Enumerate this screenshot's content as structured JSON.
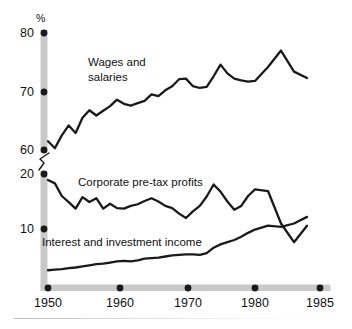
{
  "chart_data": {
    "type": "line",
    "title": "",
    "xlabel": "",
    "ylabel": "%",
    "axis_break": true,
    "grid": false,
    "legend_position": "inline-annotations",
    "x_ticks": [
      1950,
      1960,
      1970,
      1980,
      1985
    ],
    "x_tick_labels": [
      "1950",
      "1960",
      "1970",
      "1980",
      "1985"
    ],
    "y_ticks_upper": [
      60,
      70,
      80
    ],
    "y_tick_labels_upper": [
      "60",
      "70",
      "80"
    ],
    "y_ticks_lower": [
      10,
      20
    ],
    "y_tick_labels_lower": [
      "10",
      "20"
    ],
    "ylim_upper": [
      60,
      80
    ],
    "ylim_lower": [
      0,
      20
    ],
    "xlim": [
      1950,
      1985
    ],
    "units": "%",
    "series": [
      {
        "name": "Wages and salaries",
        "label_line1": "Wages and",
        "label_line2": "salaries",
        "color": "#1a1a1a",
        "x": [
          1950,
          1951,
          1952,
          1953,
          1954,
          1955,
          1956,
          1957,
          1958,
          1959,
          1960,
          1961,
          1962,
          1963,
          1964,
          1965,
          1966,
          1967,
          1968,
          1969,
          1970,
          1971,
          1972,
          1973,
          1974,
          1975,
          1976,
          1977,
          1978,
          1979,
          1980,
          1981,
          1982,
          1983,
          1984
        ],
        "values": [
          61.5,
          60.3,
          62.5,
          64.2,
          62.9,
          65.5,
          66.8,
          65.9,
          66.7,
          67.5,
          68.6,
          67.9,
          67.6,
          68.0,
          68.4,
          69.5,
          69.2,
          70.2,
          70.9,
          72.1,
          72.2,
          70.9,
          70.6,
          70.8,
          72.6,
          74.6,
          73.1,
          72.2,
          71.9,
          71.7,
          71.8,
          74.2,
          77.0,
          73.4,
          72.3
        ]
      },
      {
        "name": "Corporate pre-tax profits",
        "label_line1": "Corporate pre-tax profits",
        "color": "#1a1a1a",
        "x": [
          1950,
          1951,
          1952,
          1953,
          1954,
          1955,
          1956,
          1957,
          1958,
          1959,
          1960,
          1961,
          1962,
          1963,
          1964,
          1965,
          1966,
          1967,
          1968,
          1969,
          1970,
          1971,
          1972,
          1973,
          1974,
          1975,
          1976,
          1977,
          1978,
          1979,
          1980,
          1981,
          1982,
          1983,
          1984
        ],
        "values": [
          18.9,
          18.3,
          16.0,
          14.9,
          13.7,
          15.8,
          14.9,
          15.6,
          13.7,
          14.6,
          13.8,
          13.7,
          14.2,
          14.5,
          15.1,
          15.6,
          15.0,
          14.2,
          13.8,
          12.8,
          12.0,
          13.2,
          14.2,
          15.9,
          18.1,
          16.8,
          15.0,
          13.5,
          14.2,
          16.0,
          17.2,
          16.9,
          11.0,
          7.6,
          10.6
        ]
      },
      {
        "name": "Interest and investment income",
        "label_line1": "Interest and investment income",
        "color": "#1a1a1a",
        "x": [
          1950,
          1951,
          1952,
          1953,
          1954,
          1955,
          1956,
          1957,
          1958,
          1959,
          1960,
          1961,
          1962,
          1963,
          1964,
          1965,
          1966,
          1967,
          1968,
          1969,
          1970,
          1971,
          1972,
          1973,
          1974,
          1975,
          1976,
          1977,
          1978,
          1979,
          1980,
          1981,
          1982,
          1983,
          1984
        ],
        "values": [
          2.5,
          2.6,
          2.7,
          2.9,
          3.0,
          3.2,
          3.4,
          3.6,
          3.7,
          3.9,
          4.1,
          4.2,
          4.1,
          4.3,
          4.6,
          4.7,
          4.8,
          5.0,
          5.2,
          5.3,
          5.4,
          5.4,
          5.3,
          5.6,
          6.6,
          7.2,
          7.6,
          8.0,
          8.6,
          9.3,
          9.9,
          10.6,
          10.4,
          11.0,
          12.2
        ]
      }
    ]
  },
  "axis": {
    "y_unit_label": "%",
    "spine_color": "#c9c9c9",
    "tick_dot_color": "#1a1a1a"
  },
  "ghost_header": "",
  "colors": {
    "background": "#ffffff",
    "ink": "#1a1a1a",
    "spine": "#c9c9c9",
    "footer_rule": "#bcbcbc"
  }
}
